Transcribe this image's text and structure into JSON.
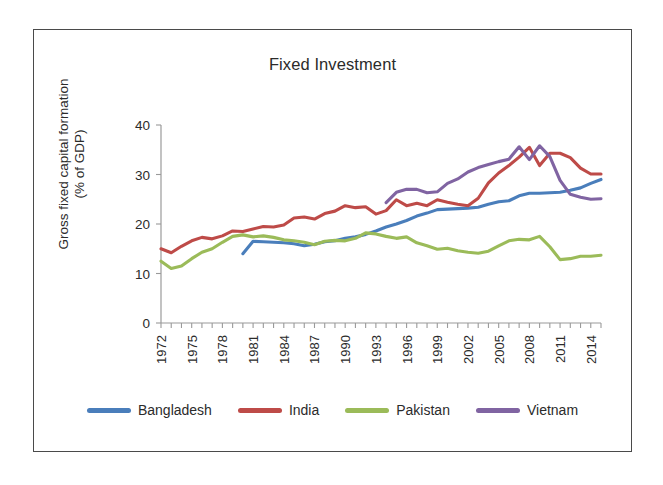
{
  "figure": {
    "title": "Fixed Investment",
    "ylabel_line1": "Gross fixed capital formation",
    "ylabel_line2": "(% of GDP)"
  },
  "legend": {
    "position": "bottom",
    "items": [
      {
        "label": "Bangladesh",
        "color": "#4A7EBB"
      },
      {
        "label": "India",
        "color": "#BE4B48"
      },
      {
        "label": "Pakistan",
        "color": "#9BBB59"
      },
      {
        "label": "Vietnam",
        "color": "#8064A2"
      }
    ]
  },
  "axes": {
    "y_ticks": [
      "0",
      "10",
      "20",
      "30",
      "40"
    ],
    "x_ticks": [
      "1972",
      "1975",
      "1978",
      "1981",
      "1984",
      "1987",
      "1990",
      "1993",
      "1996",
      "1999",
      "2002",
      "2005",
      "2008",
      "2011",
      "2014"
    ]
  },
  "chart_data": {
    "type": "line",
    "title": "Fixed Investment",
    "xlabel": "",
    "ylabel": "Gross fixed capital formation (% of GDP)",
    "ylim": [
      0,
      40
    ],
    "xlim": [
      1972,
      2015
    ],
    "grid": false,
    "legend_position": "bottom",
    "y_tick_values": [
      0,
      10,
      20,
      30,
      40
    ],
    "x_tick_values": [
      1972,
      1975,
      1978,
      1981,
      1984,
      1987,
      1990,
      1993,
      1996,
      1999,
      2002,
      2005,
      2008,
      2011,
      2014
    ],
    "x_minor_tick_interval": 1,
    "x": [
      1972,
      1973,
      1974,
      1975,
      1976,
      1977,
      1978,
      1979,
      1980,
      1981,
      1982,
      1983,
      1984,
      1985,
      1986,
      1987,
      1988,
      1989,
      1990,
      1991,
      1992,
      1993,
      1994,
      1995,
      1996,
      1997,
      1998,
      1999,
      2000,
      2001,
      2002,
      2003,
      2004,
      2005,
      2006,
      2007,
      2008,
      2009,
      2010,
      2011,
      2012,
      2013,
      2014,
      2015
    ],
    "series": [
      {
        "name": "Bangladesh",
        "color": "#4A7EBB",
        "start_year": 1980,
        "values": [
          null,
          null,
          null,
          null,
          null,
          null,
          null,
          null,
          14.0,
          16.5,
          16.4,
          16.3,
          16.2,
          16.0,
          15.6,
          15.9,
          16.4,
          16.6,
          17.1,
          17.4,
          17.9,
          18.6,
          19.4,
          20.0,
          20.7,
          21.6,
          22.2,
          22.9,
          23.0,
          23.1,
          23.2,
          23.4,
          24.0,
          24.5,
          24.7,
          25.7,
          26.2,
          26.2,
          26.3,
          26.4,
          26.8,
          27.3,
          28.2,
          29.0
        ]
      },
      {
        "name": "India",
        "color": "#BE4B48",
        "start_year": 1972,
        "values": [
          15.0,
          14.2,
          15.5,
          16.6,
          17.3,
          17.0,
          17.6,
          18.6,
          18.5,
          19.0,
          19.5,
          19.4,
          19.8,
          21.2,
          21.4,
          21.0,
          22.1,
          22.6,
          23.7,
          23.3,
          23.5,
          22.0,
          22.7,
          24.9,
          23.7,
          24.2,
          23.7,
          24.9,
          24.4,
          24.0,
          23.7,
          25.2,
          28.3,
          30.3,
          31.8,
          33.5,
          35.5,
          31.8,
          34.3,
          34.3,
          33.4,
          31.3,
          30.1,
          30.1
        ]
      },
      {
        "name": "Pakistan",
        "color": "#9BBB59",
        "start_year": 1972,
        "values": [
          12.5,
          11.0,
          11.5,
          13.0,
          14.3,
          15.0,
          16.3,
          17.5,
          17.8,
          17.4,
          17.6,
          17.3,
          16.8,
          16.6,
          16.3,
          15.8,
          16.5,
          16.7,
          16.6,
          17.1,
          18.2,
          18.0,
          17.5,
          17.1,
          17.4,
          16.2,
          15.6,
          14.9,
          15.1,
          14.6,
          14.3,
          14.1,
          14.5,
          15.6,
          16.6,
          16.9,
          16.8,
          17.5,
          15.4,
          12.8,
          13.0,
          13.5,
          13.5,
          13.7
        ]
      },
      {
        "name": "Vietnam",
        "color": "#8064A2",
        "start_year": 1994,
        "values": [
          null,
          null,
          null,
          null,
          null,
          null,
          null,
          null,
          null,
          null,
          null,
          null,
          null,
          null,
          null,
          null,
          null,
          null,
          null,
          null,
          null,
          null,
          24.3,
          26.4,
          27.0,
          27.0,
          26.3,
          26.5,
          28.2,
          29.1,
          30.5,
          31.4,
          32.0,
          32.6,
          33.1,
          35.6,
          33.0,
          35.8,
          33.6,
          28.8,
          26.0,
          25.4,
          25.0,
          25.1
        ]
      }
    ]
  }
}
